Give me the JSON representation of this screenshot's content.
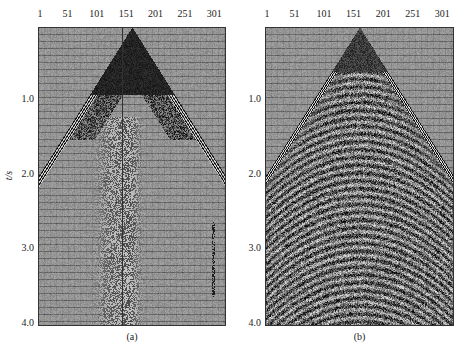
{
  "figure": {
    "panels": [
      {
        "id": "a",
        "caption": "(a)",
        "plot": {
          "left": 38,
          "top": 27,
          "width": 188,
          "height": 299
        },
        "x_ticks": [
          "1",
          "51",
          "101",
          "151",
          "201",
          "251",
          "301"
        ],
        "y_ticks": [
          "1.0",
          "2.0",
          "3.0",
          "4.0"
        ],
        "y_label": "t/s",
        "description": "Raw shot gather with strong noise cone and dead trace"
      },
      {
        "id": "b",
        "caption": "(b)",
        "plot": {
          "left": 265,
          "top": 27,
          "width": 189,
          "height": 299
        },
        "x_ticks": [
          "1",
          "51",
          "101",
          "151",
          "201",
          "251",
          "301"
        ],
        "y_ticks": [
          "1.0",
          "2.0",
          "3.0",
          "4.0"
        ],
        "y_label": "",
        "description": "Processed shot gather with reflections visible"
      }
    ]
  },
  "chart_data": [
    {
      "type": "heatmap",
      "title": "(a)",
      "xlabel": "Trace number",
      "ylabel": "t/s",
      "x_ticks": [
        1,
        51,
        101,
        151,
        201,
        251,
        301
      ],
      "y_ticks": [
        1.0,
        2.0,
        3.0,
        4.0
      ],
      "xlim": [
        1,
        320
      ],
      "ylim": [
        0,
        4.0
      ],
      "grid": true,
      "notes": "Seismic shot gather; dark triangular noise cone apex near trace 151 at t≈0; first arrivals reach edges near t≈2.0 s; dead trace near trace 140; spurious spikes near trace 301 at t≈2.7–3.5 s"
    },
    {
      "type": "heatmap",
      "title": "(b)",
      "xlabel": "Trace number",
      "ylabel": "t/s",
      "x_ticks": [
        1,
        51,
        101,
        151,
        201,
        251,
        301
      ],
      "y_ticks": [
        1.0,
        2.0,
        3.0,
        4.0
      ],
      "xlim": [
        1,
        320
      ],
      "ylim": [
        0,
        4.0
      ],
      "grid": true,
      "notes": "Processed gather; hyperbolic reflection events visible below first-arrival cone; dense noise texture beneath t≈2.0 s"
    }
  ]
}
